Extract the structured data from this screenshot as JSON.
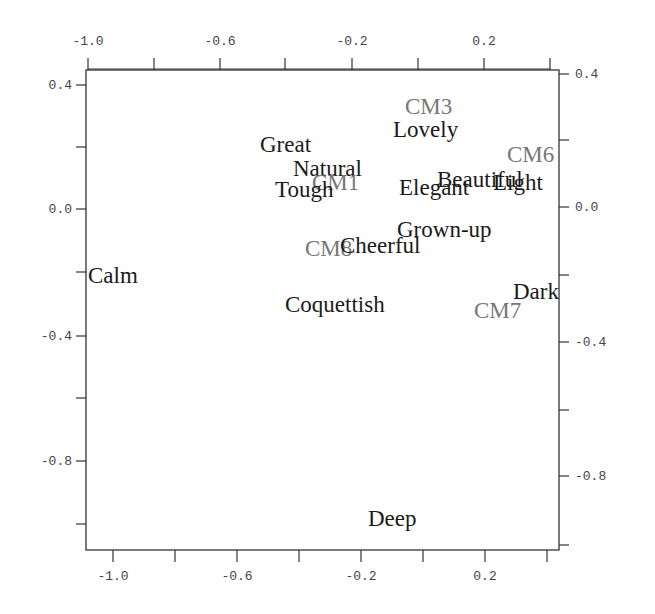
{
  "chart_data": {
    "type": "scatter",
    "title": "",
    "xlabel": "",
    "ylabel": "",
    "xlim": [
      -1.1,
      0.4
    ],
    "ylim": [
      -1.08,
      0.44
    ],
    "grid": false,
    "legend": null,
    "x_ticks_top": [
      "-1.0",
      "-0.6",
      "-0.2",
      "0.2"
    ],
    "x_ticks_bottom": [
      "-1.0",
      "-0.6",
      "-0.2",
      "0.2"
    ],
    "y_ticks_left": [
      "0.4",
      "0.0",
      "-0.4",
      "-0.8"
    ],
    "y_ticks_right": [
      "0.4",
      "0.0",
      "-0.4",
      "-0.8"
    ],
    "series": [
      {
        "name": "Adjectives",
        "color": "#1a1a1a",
        "points": [
          {
            "label": "Calm",
            "x": -1.02,
            "y": -0.22
          },
          {
            "label": "Great",
            "x": -0.44,
            "y": 0.2
          },
          {
            "label": "Natural",
            "x": -0.28,
            "y": 0.12
          },
          {
            "label": "Tough",
            "x": -0.32,
            "y": 0.06
          },
          {
            "label": "Lovely",
            "x": -0.01,
            "y": 0.28
          },
          {
            "label": "Elegant",
            "x": 0.0,
            "y": 0.06
          },
          {
            "label": "Beautiful",
            "x": 0.08,
            "y": 0.09
          },
          {
            "label": "Light",
            "x": 0.22,
            "y": 0.08
          },
          {
            "label": "Grown-up",
            "x": 0.02,
            "y": -0.07
          },
          {
            "label": "Cheerful",
            "x": -0.15,
            "y": -0.12
          },
          {
            "label": "Coquettish",
            "x": -0.3,
            "y": -0.31
          },
          {
            "label": "Dark",
            "x": 0.27,
            "y": -0.27
          },
          {
            "label": "Deep",
            "x": -0.11,
            "y": -0.98
          }
        ]
      },
      {
        "name": "Color models",
        "color": "#777777",
        "points": [
          {
            "label": "CM1",
            "x": -0.25,
            "y": 0.1
          },
          {
            "label": "CM3",
            "x": -0.03,
            "y": 0.33
          },
          {
            "label": "CM6",
            "x": 0.22,
            "y": 0.17
          },
          {
            "label": "CM8",
            "x": -0.31,
            "y": -0.13
          },
          {
            "label": "CM7",
            "x": 0.15,
            "y": -0.32
          }
        ]
      }
    ]
  },
  "render": {
    "frame": {
      "left": 86,
      "top": 70,
      "right": 559,
      "bottom": 550
    },
    "top_ticks": [
      {
        "x": 88,
        "label": "-1.0"
      },
      {
        "x": 154,
        "label": ""
      },
      {
        "x": 220,
        "label": "-0.6"
      },
      {
        "x": 285,
        "label": ""
      },
      {
        "x": 352,
        "label": "-0.2"
      },
      {
        "x": 418,
        "label": ""
      },
      {
        "x": 484,
        "label": "0.2"
      },
      {
        "x": 550,
        "label": ""
      }
    ],
    "bottom_ticks": [
      {
        "x": 113,
        "label": "-1.0"
      },
      {
        "x": 175,
        "label": ""
      },
      {
        "x": 237,
        "label": "-0.6"
      },
      {
        "x": 299,
        "label": ""
      },
      {
        "x": 361,
        "label": "-0.2"
      },
      {
        "x": 423,
        "label": ""
      },
      {
        "x": 485,
        "label": "0.2"
      },
      {
        "x": 547,
        "label": ""
      }
    ],
    "left_ticks": [
      {
        "y": 85,
        "label": "0.4"
      },
      {
        "y": 147,
        "label": ""
      },
      {
        "y": 209,
        "label": "0.0"
      },
      {
        "y": 272,
        "label": ""
      },
      {
        "y": 336,
        "label": "-0.4"
      },
      {
        "y": 398,
        "label": ""
      },
      {
        "y": 461,
        "label": "-0.8"
      },
      {
        "y": 524,
        "label": ""
      }
    ],
    "right_ticks": [
      {
        "y": 74,
        "label": "0.4"
      },
      {
        "y": 140,
        "label": ""
      },
      {
        "y": 207,
        "label": "0.0"
      },
      {
        "y": 275,
        "label": ""
      },
      {
        "y": 342,
        "label": "-0.4"
      },
      {
        "y": 410,
        "label": ""
      },
      {
        "y": 476,
        "label": "-0.8"
      },
      {
        "y": 545,
        "label": ""
      }
    ],
    "labels": [
      {
        "text": "CM3",
        "x": 405,
        "y": 114,
        "grey": true
      },
      {
        "text": "Lovely",
        "x": 393,
        "y": 137,
        "grey": false
      },
      {
        "text": "Great",
        "x": 260,
        "y": 152,
        "grey": false
      },
      {
        "text": "CM6",
        "x": 507,
        "y": 162,
        "grey": true
      },
      {
        "text": "Natural",
        "x": 293,
        "y": 176,
        "grey": false
      },
      {
        "text": "CM1",
        "x": 312,
        "y": 190,
        "grey": true
      },
      {
        "text": "Tough",
        "x": 275,
        "y": 197,
        "grey": false
      },
      {
        "text": "Beautiful",
        "x": 437,
        "y": 187,
        "grey": false
      },
      {
        "text": "Light",
        "x": 493,
        "y": 190,
        "grey": false
      },
      {
        "text": "Elegant",
        "x": 399,
        "y": 195,
        "grey": false
      },
      {
        "text": "Grown-up",
        "x": 397,
        "y": 237,
        "grey": false
      },
      {
        "text": "CM8",
        "x": 305,
        "y": 256,
        "grey": true
      },
      {
        "text": "Cheerful",
        "x": 340,
        "y": 253,
        "grey": false
      },
      {
        "text": "Calm",
        "x": 88,
        "y": 283,
        "grey": false
      },
      {
        "text": "Dark",
        "x": 513,
        "y": 299,
        "grey": false
      },
      {
        "text": "Coquettish",
        "x": 285,
        "y": 312,
        "grey": false
      },
      {
        "text": "CM7",
        "x": 474,
        "y": 318,
        "grey": true
      },
      {
        "text": "Deep",
        "x": 368,
        "y": 526,
        "grey": false
      }
    ],
    "colors": {
      "axis": "#333333",
      "text": "#1a1a1a",
      "grey_text": "#777777",
      "tick_text": "#444444"
    }
  }
}
